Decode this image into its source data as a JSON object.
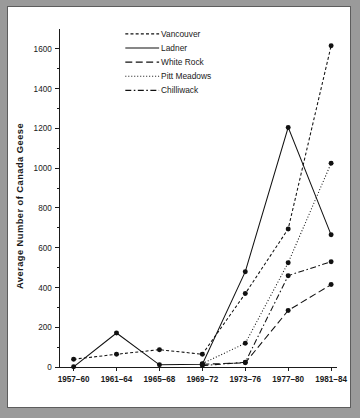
{
  "figure": {
    "background_color": "#ffffff",
    "page_color": "#9a9a9a",
    "border_color": "#5d5d5d",
    "ink_color": "#111111"
  },
  "chart_data": {
    "type": "line",
    "title": "",
    "xlabel": "",
    "ylabel": "Average Number of Canada Geese",
    "categories": [
      "1957-60",
      "1961-64",
      "1965-68",
      "1969-72",
      "1973-76",
      "1977-80",
      "1981-84"
    ],
    "ylim": [
      0,
      1700
    ],
    "yticks": [
      0,
      200,
      400,
      600,
      800,
      1000,
      1200,
      1400,
      1600
    ],
    "ytick_labels": [
      "0",
      "200",
      "400",
      "600",
      "800",
      "1000",
      "1200",
      "1400",
      "1600"
    ],
    "yminor_step": 100,
    "grid": false,
    "legend_position": "top-center",
    "series": [
      {
        "name": "Vancouver",
        "dash": "3,2.2",
        "values": [
          40,
          65,
          88,
          65,
          370,
          695,
          1615
        ]
      },
      {
        "name": "Ladner",
        "dash": "none",
        "values": [
          2,
          172,
          12,
          15,
          480,
          1205,
          665
        ]
      },
      {
        "name": "White Rock",
        "dash": "7,3.5",
        "values": [
          null,
          null,
          null,
          15,
          22,
          285,
          415
        ]
      },
      {
        "name": "Pitt Meadows",
        "dash": "1,2",
        "values": [
          null,
          null,
          null,
          18,
          120,
          525,
          1025
        ]
      },
      {
        "name": "Chilliwack",
        "dash": "6,2.5,1.6,2.5",
        "values": [
          null,
          null,
          null,
          8,
          25,
          460,
          530
        ]
      }
    ]
  }
}
